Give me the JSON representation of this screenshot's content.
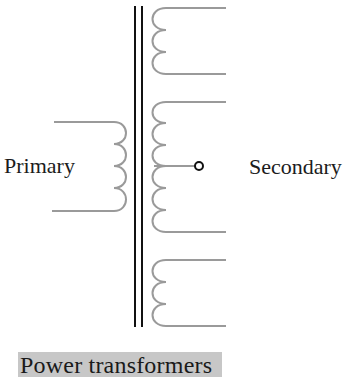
{
  "diagram": {
    "title": "Power transformers",
    "labels": {
      "primary": "Primary",
      "secondary": "Secondary"
    },
    "components": {
      "core": "laminated-iron-core",
      "primary_winding": {
        "turns": 4
      },
      "secondary_windings": [
        {
          "name": "upper-secondary",
          "turns": 3,
          "center_tap": false
        },
        {
          "name": "middle-secondary",
          "turns": 6,
          "center_tap": true
        },
        {
          "name": "lower-secondary",
          "turns": 3,
          "center_tap": false
        }
      ]
    },
    "colors": {
      "winding": "#9a9a9a",
      "core": "#111111",
      "tap_terminal": "#111111",
      "caption_background": "#c7c7c7"
    }
  }
}
